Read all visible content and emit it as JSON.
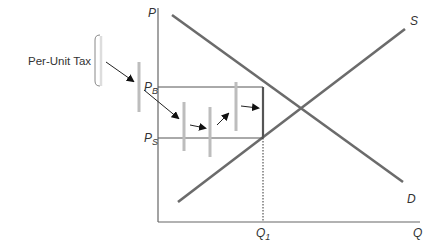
{
  "diagram": {
    "y_axis_label": "P",
    "x_axis_label": "Q",
    "supply_label": "S",
    "demand_label": "D",
    "buyer_price_label": "P",
    "buyer_price_sub": "B",
    "seller_price_label": "P",
    "seller_price_sub": "S",
    "quantity_label": "Q",
    "quantity_sub": "1",
    "annotation": "Per-Unit Tax"
  }
}
